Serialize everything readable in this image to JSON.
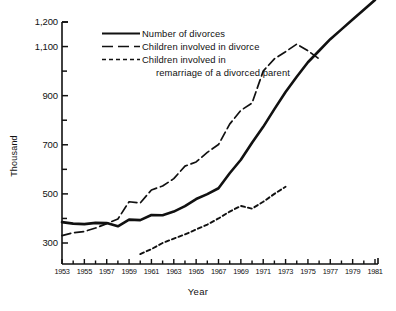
{
  "chart_data": {
    "type": "line",
    "title": "",
    "xlabel": "Year",
    "ylabel": "Thousand",
    "xlim": [
      1953,
      1981
    ],
    "ylim": [
      200,
      1290
    ],
    "grid": false,
    "legend_position": "top-center",
    "y_ticks_labeled": [
      "1,200",
      "1,100",
      "900",
      "700",
      "500",
      "300"
    ],
    "y_tick_values_labeled": [
      1200,
      1100,
      900,
      700,
      500,
      300
    ],
    "y_tick_values_all": [
      1200,
      1100,
      1000,
      900,
      800,
      700,
      600,
      500,
      400,
      300
    ],
    "x_tick_labels": [
      "1953",
      "1955",
      "1957",
      "1959",
      "1961",
      "1963",
      "1965",
      "1967",
      "1969",
      "1971",
      "1973",
      "1975",
      "1977",
      "1979",
      "1981"
    ],
    "x_tick_values_labeled": [
      1953,
      1955,
      1957,
      1959,
      1961,
      1963,
      1965,
      1967,
      1969,
      1971,
      1973,
      1975,
      1977,
      1979,
      1981
    ],
    "series": [
      {
        "name": "Number of divorces",
        "style": "solid",
        "x": [
          1953,
          1954,
          1955,
          1956,
          1957,
          1958,
          1959,
          1960,
          1961,
          1962,
          1963,
          1964,
          1965,
          1966,
          1967,
          1968,
          1969,
          1970,
          1971,
          1972,
          1973,
          1974,
          1975,
          1976,
          1977,
          1978,
          1979,
          1980,
          1981
        ],
        "values": [
          385,
          379,
          377,
          382,
          381,
          368,
          395,
          393,
          414,
          413,
          428,
          450,
          479,
          499,
          523,
          584,
          639,
          708,
          773,
          845,
          915,
          977,
          1036,
          1083,
          1130,
          1170,
          1210,
          1250,
          1290
        ]
      },
      {
        "name": "Children involved in divorce",
        "style": "long-dash",
        "x": [
          1953,
          1954,
          1955,
          1956,
          1957,
          1958,
          1959,
          1960,
          1961,
          1962,
          1963,
          1964,
          1965,
          1966,
          1967,
          1968,
          1969,
          1970,
          1971,
          1972,
          1973,
          1974,
          1975,
          1976
        ],
        "values": [
          330,
          342,
          347,
          361,
          379,
          398,
          468,
          463,
          516,
          532,
          562,
          613,
          630,
          669,
          701,
          784,
          840,
          870,
          1000,
          1050,
          1079,
          1110,
          1083,
          1050
        ]
      },
      {
        "name": "Children involved in remarriage of a divorced parent",
        "style": "short-dash",
        "x": [
          1960,
          1961,
          1962,
          1963,
          1964,
          1965,
          1966,
          1967,
          1968,
          1969,
          1970,
          1971,
          1972,
          1973
        ],
        "values": [
          255,
          275,
          300,
          318,
          335,
          355,
          375,
          400,
          428,
          451,
          440,
          468,
          500,
          529
        ]
      }
    ]
  },
  "axes": {
    "y_axis_title": "Thousand",
    "x_axis_title": "Year"
  },
  "legend": {
    "items": [
      {
        "label": "Number of divorces",
        "style": "solid"
      },
      {
        "label": "Children involved in divorce",
        "style": "long-dash"
      },
      {
        "label": "Children involved in",
        "label_line2": "remarriage of a divorced parent",
        "style": "short-dash"
      }
    ]
  }
}
